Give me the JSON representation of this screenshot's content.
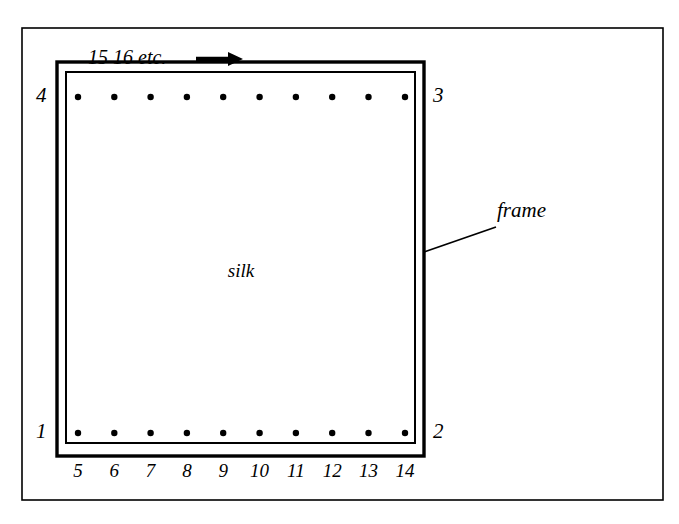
{
  "figure": {
    "type": "technical-diagram",
    "background_color": "#ffffff",
    "ink_color": "#000000",
    "outer_border": {
      "x": 22,
      "y": 28,
      "width": 641,
      "height": 472
    },
    "frame_outer": {
      "x": 57,
      "y": 62,
      "width": 367,
      "height": 394
    },
    "frame_inner": {
      "x": 66,
      "y": 72,
      "width": 349,
      "height": 371
    }
  },
  "labels": {
    "silk": "silk",
    "frame": "frame",
    "top_sequence": "15 16 etc.",
    "arrow_icon": "arrow-right-icon"
  },
  "corners": [
    {
      "id": "corner-1",
      "label": "1",
      "position": "bottom-left",
      "x": 42,
      "y": 433
    },
    {
      "id": "corner-2",
      "label": "2",
      "position": "bottom-right",
      "x": 440,
      "y": 433
    },
    {
      "id": "corner-3",
      "label": "3",
      "position": "top-right",
      "x": 440,
      "y": 97
    },
    {
      "id": "corner-4",
      "label": "4",
      "position": "top-left",
      "x": 42,
      "y": 97
    }
  ],
  "bottom_numbers": [
    "5",
    "6",
    "7",
    "8",
    "9",
    "10",
    "11",
    "12",
    "13",
    "14"
  ],
  "dots": {
    "count_per_row": 10,
    "radius": 3.2,
    "top_row_y": 97,
    "bottom_row_y": 433,
    "x_positions": [
      78,
      114.3,
      150.6,
      186.9,
      223.2,
      259.6,
      295.9,
      332.2,
      368.5,
      405
    ]
  },
  "leader_line": {
    "name": "frame-leader-line",
    "from_x": 424,
    "from_y": 252,
    "to_x": 496,
    "to_y": 227
  },
  "arrow": {
    "shaft_x1": 196,
    "shaft_x2": 228,
    "y": 59,
    "head_tip_x": 240
  },
  "chart_data": {
    "type": "diagram",
    "annotations": [
      "silk",
      "frame",
      "15 16 etc."
    ],
    "corner_points": [
      "1",
      "2",
      "3",
      "4"
    ],
    "edge_points": [
      "5",
      "6",
      "7",
      "8",
      "9",
      "10",
      "11",
      "12",
      "13",
      "14"
    ],
    "point_rows": [
      {
        "name": "top-edge-holes",
        "count": 10
      },
      {
        "name": "bottom-edge-holes",
        "count": 10
      }
    ]
  }
}
